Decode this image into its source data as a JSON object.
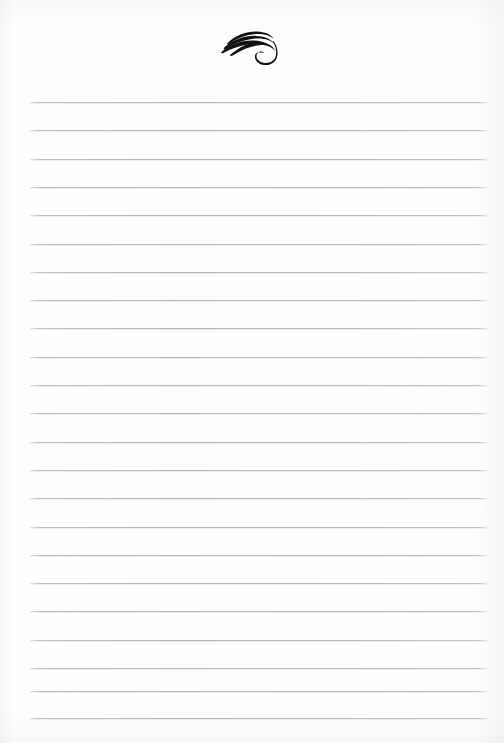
{
  "document": {
    "kind": "lined-notepaper",
    "title": "Blank ruled writing page",
    "page_number": "",
    "background_color": "#fefefe",
    "body_text": ""
  },
  "header": {
    "ornament": {
      "icon_name": "calligraphic-flourish-ornament",
      "description": "Three-stroke calligraphic swash with descending hook",
      "color": "#111111",
      "center_x": 260,
      "top": 30,
      "width": 56,
      "height": 32
    }
  },
  "ruling": {
    "line_color": "#b6b6be",
    "line_thickness": 1,
    "left_margin": 30,
    "right_margin": 487,
    "first_line_y": 102,
    "line_spacing": 28.3,
    "line_count": 23,
    "lines": [
      {
        "index": 1,
        "y": 102,
        "text": ""
      },
      {
        "index": 2,
        "y": 130.3,
        "text": ""
      },
      {
        "index": 3,
        "y": 158.6,
        "text": ""
      },
      {
        "index": 4,
        "y": 186.9,
        "text": ""
      },
      {
        "index": 5,
        "y": 215.2,
        "text": ""
      },
      {
        "index": 6,
        "y": 243.5,
        "text": ""
      },
      {
        "index": 7,
        "y": 271.8,
        "text": ""
      },
      {
        "index": 8,
        "y": 300.1,
        "text": ""
      },
      {
        "index": 9,
        "y": 328.4,
        "text": ""
      },
      {
        "index": 10,
        "y": 356.7,
        "text": ""
      },
      {
        "index": 11,
        "y": 385.0,
        "text": ""
      },
      {
        "index": 12,
        "y": 413.3,
        "text": ""
      },
      {
        "index": 13,
        "y": 441.6,
        "text": ""
      },
      {
        "index": 14,
        "y": 469.9,
        "text": ""
      },
      {
        "index": 15,
        "y": 498.2,
        "text": ""
      },
      {
        "index": 16,
        "y": 526.5,
        "text": ""
      },
      {
        "index": 17,
        "y": 554.8,
        "text": ""
      },
      {
        "index": 18,
        "y": 583.1,
        "text": ""
      },
      {
        "index": 19,
        "y": 611.4,
        "text": ""
      },
      {
        "index": 20,
        "y": 639.7,
        "text": ""
      },
      {
        "index": 21,
        "y": 668.0,
        "text": ""
      },
      {
        "index": 22,
        "y": 690.5,
        "text": ""
      },
      {
        "index": 23,
        "y": 718.0,
        "text": ""
      }
    ]
  }
}
